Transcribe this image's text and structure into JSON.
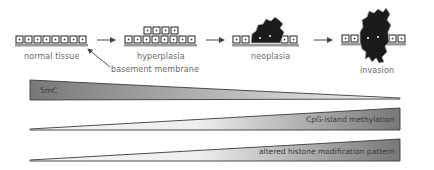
{
  "stages": [
    {
      "id": "normal",
      "label": "normal tissue"
    },
    {
      "id": "hyperplasia",
      "label": "hyperplasia"
    },
    {
      "id": "neoplasia",
      "label": "neoplasia"
    },
    {
      "id": "invasion",
      "label": "invasion"
    }
  ],
  "annotation": {
    "label": "basement membrane"
  },
  "wedges": [
    {
      "label": "5mC",
      "direction": "decreasing"
    },
    {
      "label": "CpG-island methylation",
      "direction": "increasing"
    },
    {
      "label": "altered histone modification pattern",
      "direction": "increasing"
    }
  ],
  "colors": {
    "wedge_dark": "#7a7a7a",
    "wedge_light": "#f2f2f2",
    "outline": "#3a3a3a",
    "label_text": "#6a6a6a",
    "cell_fill": "#ffffff",
    "tumor_fill": "#1a1a1a",
    "membrane": "#9a9a9a"
  }
}
